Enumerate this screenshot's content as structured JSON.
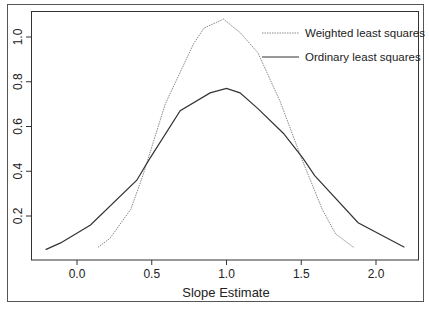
{
  "chart_data": {
    "type": "line",
    "title": "",
    "xlabel": "Slope Estimate",
    "ylabel": "",
    "xlim": [
      -0.3,
      2.3
    ],
    "ylim": [
      0.0,
      1.1
    ],
    "grid": false,
    "legend_position": "top-right",
    "x_ticks": [
      "0.0",
      "0.5",
      "1.0",
      "1.5",
      "2.0"
    ],
    "x_tick_values": [
      0.0,
      0.5,
      1.0,
      1.5,
      2.0
    ],
    "y_ticks": [
      "0.2",
      "0.4",
      "0.6",
      "0.8",
      "1.0"
    ],
    "y_tick_values": [
      0.2,
      0.4,
      0.6,
      0.8,
      1.0
    ],
    "series": [
      {
        "name": "Weighted least squares",
        "style": "dotted",
        "color": "#888888",
        "x": [
          0.14,
          0.22,
          0.36,
          0.44,
          0.59,
          0.78,
          0.85,
          0.98,
          1.09,
          1.21,
          1.36,
          1.5,
          1.64,
          1.73,
          1.85
        ],
        "y": [
          0.06,
          0.1,
          0.23,
          0.38,
          0.7,
          0.97,
          1.04,
          1.08,
          1.02,
          0.93,
          0.71,
          0.46,
          0.23,
          0.12,
          0.06
        ]
      },
      {
        "name": "Ordinary least squares",
        "style": "solid",
        "color": "#333333",
        "x": [
          -0.21,
          -0.11,
          0.09,
          0.4,
          0.48,
          0.69,
          0.89,
          1.0,
          1.09,
          1.21,
          1.38,
          1.51,
          1.59,
          1.88,
          2.19
        ],
        "y": [
          0.05,
          0.08,
          0.16,
          0.36,
          0.45,
          0.67,
          0.75,
          0.77,
          0.75,
          0.68,
          0.57,
          0.46,
          0.38,
          0.17,
          0.06
        ]
      }
    ]
  },
  "legend": {
    "items": [
      {
        "label": "Weighted least squares",
        "style": "dotted"
      },
      {
        "label": "Ordinary least squares",
        "style": "solid"
      }
    ]
  },
  "axes": {
    "x_title": "Slope Estimate",
    "x_ticks": [
      "0.0",
      "0.5",
      "1.0",
      "1.5",
      "2.0"
    ],
    "y_ticks": [
      "0.2",
      "0.4",
      "0.6",
      "0.8",
      "1.0"
    ]
  }
}
